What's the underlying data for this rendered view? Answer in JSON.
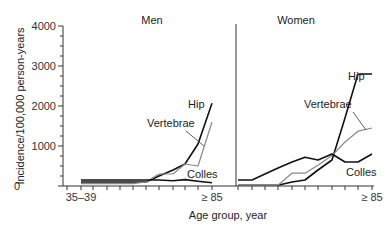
{
  "chart_data": [
    {
      "type": "line",
      "title": "Men",
      "xlabel": "Age group, year",
      "ylabel": "Incidence/100,000 person-years",
      "ylim": [
        0,
        4000
      ],
      "yticks": [
        0,
        1000,
        2000,
        3000,
        4000
      ],
      "categories": [
        "35-39",
        "40-44",
        "45-49",
        "50-54",
        "55-59",
        "60-64",
        "65-69",
        "70-74",
        "75-79",
        "80-84",
        "≥ 85"
      ],
      "x_tick_labels_shown": [
        "35–39",
        "≥ 85"
      ],
      "grid": false,
      "series": [
        {
          "name": "Hip",
          "color": "#111111",
          "values": [
            100,
            100,
            100,
            100,
            100,
            100,
            250,
            400,
            550,
            1050,
            2070
          ]
        },
        {
          "name": "Vertebrae",
          "color": "#888888",
          "values": [
            60,
            60,
            60,
            60,
            60,
            100,
            300,
            300,
            550,
            500,
            1600
          ]
        },
        {
          "name": "Colles",
          "color": "#111111",
          "values": [
            150,
            150,
            150,
            150,
            150,
            150,
            150,
            130,
            160,
            120,
            80
          ]
        }
      ],
      "annotations": [
        "Hip",
        "Vertebrae",
        "Colles"
      ]
    },
    {
      "type": "line",
      "title": "Women",
      "xlabel": "Age group, year",
      "ylabel": "Incidence/100,000 person-years",
      "ylim": [
        0,
        4000
      ],
      "categories": [
        "35-39",
        "40-44",
        "45-49",
        "50-54",
        "55-59",
        "60-64",
        "65-69",
        "70-74",
        "75-79",
        "80-84",
        "≥ 85"
      ],
      "x_tick_labels_shown": [
        "≥ 85"
      ],
      "grid": false,
      "series": [
        {
          "name": "Hip",
          "color": "#111111",
          "values": [
            20,
            20,
            20,
            20,
            100,
            150,
            400,
            650,
            1700,
            2800,
            2800
          ]
        },
        {
          "name": "Vertebrae",
          "color": "#888888",
          "values": [
            20,
            20,
            20,
            20,
            320,
            320,
            520,
            760,
            1100,
            1370,
            1450
          ]
        },
        {
          "name": "Colles",
          "color": "#111111",
          "values": [
            150,
            150,
            300,
            450,
            600,
            720,
            650,
            800,
            600,
            600,
            800
          ]
        }
      ],
      "annotations": [
        "Hip",
        "Vertebrae",
        "Colles"
      ]
    }
  ],
  "labels": {
    "men_title": "Men",
    "women_title": "Women",
    "ylabel": "Incidence/100,000 person-years",
    "xlabel": "Age group, year",
    "ytick_0": "0",
    "ytick_1000": "1000",
    "ytick_2000": "2000",
    "ytick_3000": "3000",
    "ytick_4000": "4000",
    "men_x_first": "35–39",
    "men_x_last": "≥ 85",
    "women_x_last": "≥ 85",
    "men_hip": "Hip",
    "men_vertebrae": "Vertebrae",
    "men_colles": "Colles",
    "women_hip": "Hip",
    "women_vertebrae": "Vertebrae",
    "women_colles": "Colles"
  }
}
